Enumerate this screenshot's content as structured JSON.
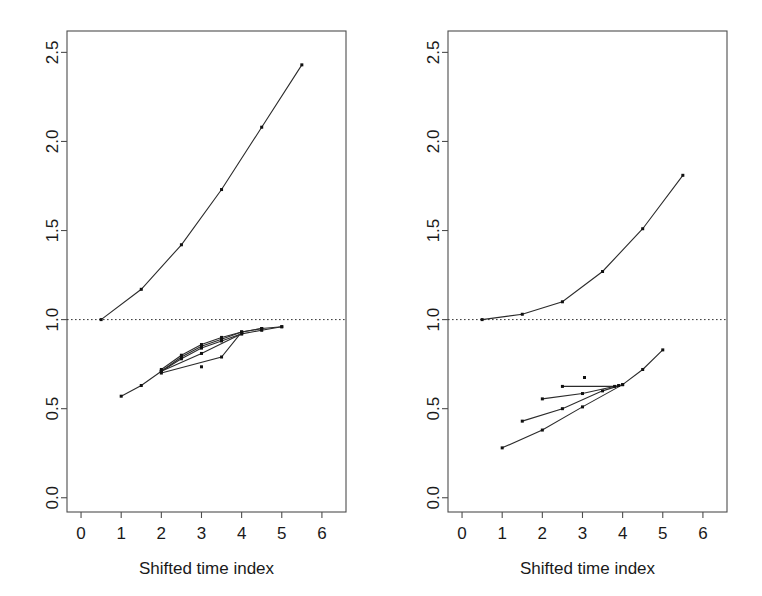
{
  "figure": {
    "width": 762,
    "height": 596,
    "background": "#ffffff",
    "panel_count": 2
  },
  "chart_data": [
    {
      "type": "line",
      "panel": "left",
      "title": "",
      "xlabel": "Shifted time index",
      "ylabel": "",
      "xlim": [
        -0.35,
        6.6
      ],
      "ylim": [
        -0.08,
        2.62
      ],
      "xticks": [
        0,
        1,
        2,
        3,
        4,
        5,
        6
      ],
      "xtick_labels": [
        "0",
        "1",
        "2",
        "3",
        "4",
        "5",
        "6"
      ],
      "yticks": [
        0.0,
        0.5,
        1.0,
        1.5,
        2.0,
        2.5
      ],
      "ytick_labels": [
        "0.0",
        "0.5",
        "1.0",
        "1.5",
        "2.0",
        "2.5"
      ],
      "grid": false,
      "legend": "none",
      "annotations": [
        {
          "kind": "hline",
          "y": 1.0,
          "style": "dotted",
          "label": "reference level 1.0"
        }
      ],
      "series": [
        {
          "name": "upper-curve",
          "marker": "point",
          "x": [
            0.5,
            1.5,
            2.5,
            3.5,
            4.5,
            5.5
          ],
          "values": [
            1.0,
            1.17,
            1.42,
            1.73,
            2.08,
            2.43
          ]
        },
        {
          "name": "lower-curve-1",
          "marker": "point",
          "x": [
            1.0,
            1.5,
            2.0,
            2.5,
            3.0,
            3.5,
            4.0,
            4.5,
            5.0
          ],
          "values": [
            0.57,
            0.63,
            0.71,
            0.78,
            0.84,
            0.88,
            0.92,
            0.94,
            0.96
          ]
        },
        {
          "name": "lower-curve-2",
          "marker": "point",
          "x": [
            2.0,
            2.5,
            3.0,
            3.5,
            4.0,
            4.5,
            5.0
          ],
          "values": [
            0.71,
            0.79,
            0.85,
            0.89,
            0.93,
            0.95,
            0.96
          ]
        },
        {
          "name": "lower-curve-3",
          "marker": "point",
          "x": [
            2.0,
            2.5,
            3.0,
            3.5,
            4.0,
            4.5
          ],
          "values": [
            0.72,
            0.8,
            0.86,
            0.9,
            0.93,
            0.95
          ]
        },
        {
          "name": "lower-curve-4",
          "marker": "point",
          "x": [
            2.0,
            3.0,
            4.0
          ],
          "values": [
            0.71,
            0.81,
            0.92
          ]
        },
        {
          "name": "lower-curve-5",
          "marker": "point",
          "x": [
            2.0,
            3.5,
            4.0
          ],
          "values": [
            0.7,
            0.79,
            0.93
          ]
        },
        {
          "name": "isolated-point",
          "marker": "point",
          "x": [
            3.0
          ],
          "values": [
            0.735
          ]
        }
      ]
    },
    {
      "type": "line",
      "panel": "right",
      "title": "",
      "xlabel": "Shifted time index",
      "ylabel": "",
      "xlim": [
        -0.35,
        6.6
      ],
      "ylim": [
        -0.08,
        2.62
      ],
      "xticks": [
        0,
        1,
        2,
        3,
        4,
        5,
        6
      ],
      "xtick_labels": [
        "0",
        "1",
        "2",
        "3",
        "4",
        "5",
        "6"
      ],
      "yticks": [
        0.0,
        0.5,
        1.0,
        1.5,
        2.0,
        2.5
      ],
      "ytick_labels": [
        "0.0",
        "0.5",
        "1.0",
        "1.5",
        "2.0",
        "2.5"
      ],
      "grid": false,
      "legend": "none",
      "annotations": [
        {
          "kind": "hline",
          "y": 1.0,
          "style": "dotted",
          "label": "reference level 1.0"
        }
      ],
      "series": [
        {
          "name": "upper-curve",
          "marker": "point",
          "x": [
            0.5,
            1.5,
            2.5,
            3.5,
            4.5,
            5.5
          ],
          "values": [
            1.0,
            1.03,
            1.1,
            1.27,
            1.51,
            1.81
          ]
        },
        {
          "name": "lower-curve-1",
          "marker": "point",
          "x": [
            1.0,
            2.0,
            3.0,
            4.0,
            4.5,
            5.0
          ],
          "values": [
            0.28,
            0.38,
            0.51,
            0.635,
            0.72,
            0.83
          ]
        },
        {
          "name": "lower-curve-2",
          "marker": "point",
          "x": [
            1.5,
            2.5,
            3.5,
            4.0
          ],
          "values": [
            0.43,
            0.5,
            0.6,
            0.635
          ]
        },
        {
          "name": "lower-curve-3",
          "marker": "point",
          "x": [
            2.0,
            3.0,
            3.9
          ],
          "values": [
            0.555,
            0.585,
            0.63
          ]
        },
        {
          "name": "lower-curve-4",
          "marker": "point",
          "x": [
            2.5,
            3.8
          ],
          "values": [
            0.625,
            0.625
          ]
        },
        {
          "name": "isolated-point",
          "marker": "point",
          "x": [
            3.05
          ],
          "values": [
            0.675
          ]
        }
      ]
    }
  ]
}
